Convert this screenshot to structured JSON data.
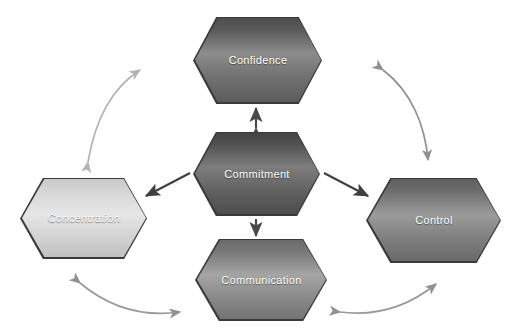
{
  "diagram": {
    "background": "#ffffff",
    "nodes": [
      {
        "id": "confidence",
        "label": "Confidence",
        "position": "top",
        "fill": "#8c8c8c",
        "text_color": "#ffffff"
      },
      {
        "id": "commitment",
        "label": "Commitment",
        "position": "center",
        "fill": "#7d7d7d",
        "text_color": "#ffffff"
      },
      {
        "id": "concentration",
        "label": "Concentration",
        "position": "left",
        "fill": "#e6e6e6",
        "text_color": "#ffffff"
      },
      {
        "id": "control",
        "label": "Control",
        "position": "right",
        "fill": "#9b9b9b",
        "text_color": "#ffffff"
      },
      {
        "id": "communication",
        "label": "Communication",
        "position": "bottom",
        "fill": "#a5a5a5",
        "text_color": "#ffffff"
      }
    ],
    "connectors": [
      {
        "id": "commitment-confidence",
        "from": "commitment",
        "to": "confidence",
        "style": "straight",
        "heads": "double",
        "color": "#4a4a4a"
      },
      {
        "id": "commitment-communication",
        "from": "commitment",
        "to": "communication",
        "style": "straight",
        "heads": "single",
        "color": "#4a4a4a"
      },
      {
        "id": "commitment-concentration",
        "from": "commitment",
        "to": "concentration",
        "style": "straight",
        "heads": "single",
        "color": "#3f3f3f"
      },
      {
        "id": "commitment-control",
        "from": "commitment",
        "to": "control",
        "style": "straight",
        "heads": "single",
        "color": "#3f3f3f"
      },
      {
        "id": "concentration-confidence",
        "from": "concentration",
        "to": "confidence",
        "style": "curved",
        "heads": "double",
        "color": "#b4b4b4"
      },
      {
        "id": "confidence-control",
        "from": "confidence",
        "to": "control",
        "style": "curved",
        "heads": "double",
        "color": "#8f8f8f"
      },
      {
        "id": "concentration-communication",
        "from": "concentration",
        "to": "communication",
        "style": "curved",
        "heads": "double",
        "color": "#9a9a9a"
      },
      {
        "id": "communication-control",
        "from": "communication",
        "to": "control",
        "style": "curved",
        "heads": "double",
        "color": "#9a9a9a"
      }
    ]
  }
}
